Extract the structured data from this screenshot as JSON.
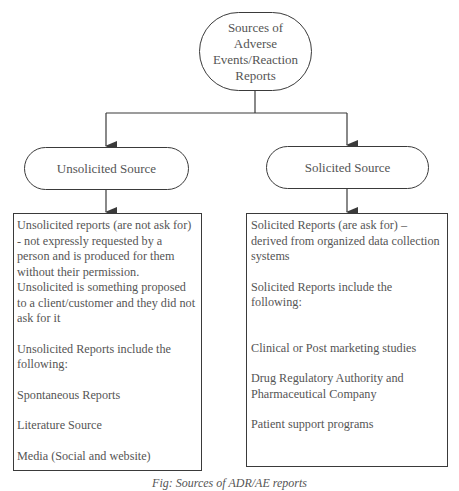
{
  "diagram": {
    "root": {
      "label": "Sources of Adverse Events/Reaction Reports"
    },
    "branches": [
      {
        "label": "Unsolicited Source",
        "description": [
          "Unsolicited reports (are not ask for) - not expressly requested by a person and is produced for them without their permission. Unsolicited is something proposed to a client/customer and they did not ask for it"
        ],
        "include_intro": "Unsolicited Reports include the following:",
        "items": [
          "Spontaneous Reports",
          "Literature Source",
          "Media (Social and website)"
        ]
      },
      {
        "label": "Solicited Source",
        "description": [
          "Solicited Reports (are ask for) – derived from organized data collection systems"
        ],
        "include_intro": "Solicited Reports include the following:",
        "items": [
          "Clinical or Post marketing studies",
          "Drug Regulatory Authority and Pharmaceutical Company",
          "Patient support programs"
        ]
      }
    ],
    "caption": "Fig: Sources of ADR/AE reports"
  },
  "colors": {
    "line": "#3a3a3a",
    "text": "#555555",
    "background": "#ffffff"
  }
}
